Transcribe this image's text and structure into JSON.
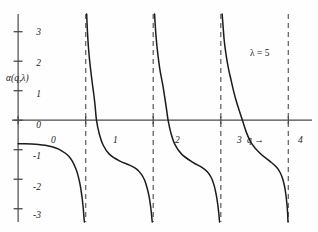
{
  "chart_data": {
    "type": "line",
    "title": "",
    "subtitle": "",
    "xlabel": "q",
    "ylabel": "α(q,λ)",
    "xlim": [
      -0.12,
      4.35
    ],
    "ylim": [
      -3.45,
      3.6
    ],
    "xticks": [
      0,
      1,
      2,
      3,
      4
    ],
    "xtick_labels": [
      "0",
      "1",
      "2",
      "3",
      "4"
    ],
    "yticks": [
      3,
      2,
      1,
      0,
      -1,
      -2,
      -3
    ],
    "ytick_labels": [
      "3",
      "2",
      "1",
      "0",
      "-1",
      "-2",
      "-3"
    ],
    "grid": false,
    "legend": null,
    "annotations": [
      {
        "text": "λ = 5",
        "x": 3.27,
        "y": 2.45
      },
      {
        "text": "q  →",
        "x": 3.12,
        "y": -0.32
      },
      {
        "text": "0",
        "x": 0.05,
        "y": -0.32
      }
    ],
    "asymptotes": {
      "style": "dashed",
      "x": [
        1,
        2,
        3,
        4
      ],
      "labels": [
        "1",
        "2",
        "3",
        "4"
      ]
    },
    "zero_crossings": [
      1.16,
      2.22,
      3.32
    ],
    "branch_start_value": -0.8,
    "series": [
      {
        "name": "α(q,λ=5) branch 0",
        "points": [
          [
            0.0,
            -0.8
          ],
          [
            0.1,
            -0.8
          ],
          [
            0.2,
            -0.805
          ],
          [
            0.3,
            -0.82
          ],
          [
            0.4,
            -0.85
          ],
          [
            0.5,
            -0.9
          ],
          [
            0.6,
            -0.98
          ],
          [
            0.7,
            -1.12
          ],
          [
            0.75,
            -1.22
          ],
          [
            0.8,
            -1.38
          ],
          [
            0.85,
            -1.62
          ],
          [
            0.88,
            -1.82
          ],
          [
            0.91,
            -2.1
          ],
          [
            0.93,
            -2.35
          ],
          [
            0.95,
            -2.68
          ],
          [
            0.965,
            -3.0
          ],
          [
            0.975,
            -3.3
          ],
          [
            0.982,
            -3.45
          ]
        ]
      },
      {
        "name": "α(q,λ=5) branch 1",
        "points": [
          [
            1.015,
            3.6
          ],
          [
            1.02,
            3.3
          ],
          [
            1.03,
            2.85
          ],
          [
            1.04,
            2.5
          ],
          [
            1.055,
            2.1
          ],
          [
            1.07,
            1.78
          ],
          [
            1.085,
            1.5
          ],
          [
            1.1,
            1.22
          ],
          [
            1.12,
            0.88
          ],
          [
            1.14,
            0.48
          ],
          [
            1.16,
            0.0
          ],
          [
            1.2,
            -0.45
          ],
          [
            1.26,
            -0.85
          ],
          [
            1.35,
            -1.15
          ],
          [
            1.5,
            -1.38
          ],
          [
            1.65,
            -1.52
          ],
          [
            1.75,
            -1.65
          ],
          [
            1.82,
            -1.82
          ],
          [
            1.87,
            -2.02
          ],
          [
            1.91,
            -2.3
          ],
          [
            1.94,
            -2.6
          ],
          [
            1.96,
            -2.9
          ],
          [
            1.975,
            -3.2
          ],
          [
            1.985,
            -3.45
          ]
        ]
      },
      {
        "name": "α(q,λ=5) branch 2",
        "points": [
          [
            2.02,
            3.6
          ],
          [
            2.03,
            3.2
          ],
          [
            2.045,
            2.75
          ],
          [
            2.06,
            2.4
          ],
          [
            2.08,
            2.02
          ],
          [
            2.1,
            1.7
          ],
          [
            2.12,
            1.45
          ],
          [
            2.145,
            1.15
          ],
          [
            2.17,
            0.78
          ],
          [
            2.195,
            0.4
          ],
          [
            2.22,
            0.0
          ],
          [
            2.26,
            -0.42
          ],
          [
            2.32,
            -0.82
          ],
          [
            2.42,
            -1.15
          ],
          [
            2.58,
            -1.42
          ],
          [
            2.72,
            -1.6
          ],
          [
            2.8,
            -1.75
          ],
          [
            2.86,
            -1.95
          ],
          [
            2.9,
            -2.2
          ],
          [
            2.93,
            -2.5
          ],
          [
            2.955,
            -2.85
          ],
          [
            2.97,
            -3.15
          ],
          [
            2.982,
            -3.45
          ]
        ]
      },
      {
        "name": "α(q,λ=5) branch 3",
        "points": [
          [
            3.02,
            3.6
          ],
          [
            3.035,
            3.15
          ],
          [
            3.05,
            2.72
          ],
          [
            3.07,
            2.35
          ],
          [
            3.095,
            1.98
          ],
          [
            3.12,
            1.68
          ],
          [
            3.15,
            1.38
          ],
          [
            3.18,
            1.08
          ],
          [
            3.22,
            0.72
          ],
          [
            3.27,
            0.35
          ],
          [
            3.32,
            0.0
          ],
          [
            3.38,
            -0.42
          ],
          [
            3.46,
            -0.8
          ],
          [
            3.58,
            -1.12
          ],
          [
            3.72,
            -1.38
          ],
          [
            3.82,
            -1.58
          ],
          [
            3.88,
            -1.78
          ],
          [
            3.92,
            -2.02
          ],
          [
            3.95,
            -2.32
          ],
          [
            3.97,
            -2.65
          ],
          [
            3.985,
            -3.0
          ],
          [
            3.995,
            -3.45
          ]
        ]
      }
    ]
  },
  "style": {
    "curve_color": "#1b1b1b",
    "axis_color": "#4a4a4a",
    "asymptote_color": "#6f6f6f",
    "background": "#fefefe"
  },
  "labels": {
    "y_axis_title": "α(q,λ)",
    "x_axis_arrow": "q  →",
    "lambda_annotation": "λ = 5",
    "origin_label": "0"
  }
}
